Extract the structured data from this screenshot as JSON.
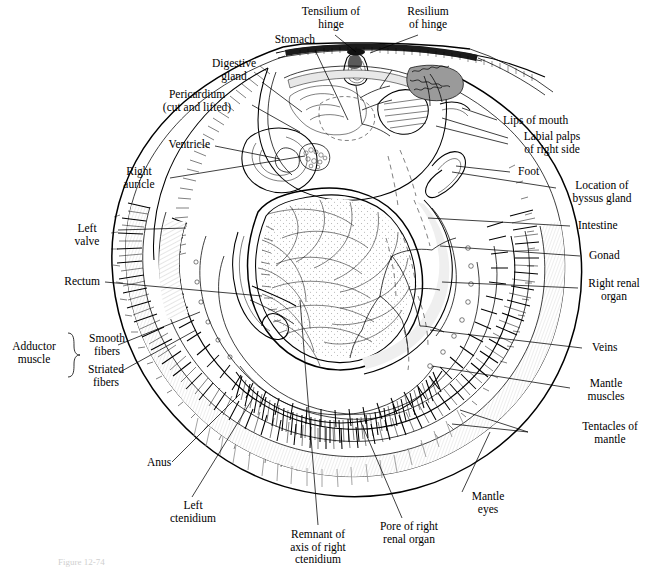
{
  "figure": {
    "type": "anatomical-line-diagram",
    "background_color": "#ffffff",
    "ink_color": "#000000",
    "label_count": 25
  },
  "caption": {
    "text": "Figure 12-74"
  },
  "labels": {
    "tensilium_of_hinge": "Tensilium of\nhinge",
    "resilium_of_hinge": "Resilium\nof hinge",
    "stomach": "Stomach",
    "digestive_gland": "Digestive\ngland",
    "pericardium": "Pericardium\n(cut and lifted)",
    "ventricle": "Ventricle",
    "right_auricle": "Right\nauricle",
    "left_valve": "Left\nvalve",
    "rectum": "Rectum",
    "adductor_muscle": "Adductor\nmuscle",
    "smooth_fibers": "Smooth\nfibers",
    "striated_fibers": "Striated\nfibers",
    "anus": "Anus",
    "left_ctenidium": "Left\nctenidium",
    "remnant_of_axis": "Remnant of\naxis of right\nctenidium",
    "pore_of_right_renal_organ": "Pore of right\nrenal organ",
    "mantle_eyes": "Mantle\neyes",
    "tentacles_of_mantle": "Tentacles of\nmantle",
    "mantle_muscles": "Mantle\nmuscles",
    "veins": "Veins",
    "right_renal_organ": "Right renal\norgan",
    "gonad": "Gonad",
    "intestine": "Intestine",
    "location_of_byssus_gland": "Location of\nbyssus gland",
    "foot": "Foot",
    "labial_palps": "Labial palps\nof right side",
    "lips_of_mouth": "Lips of mouth"
  }
}
